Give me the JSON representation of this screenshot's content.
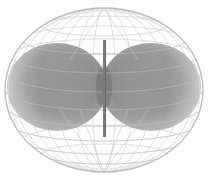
{
  "figure": {
    "title": "Dipole antenna radiation pattern",
    "colors": {
      "background": "#ffffff",
      "sphere_outline": "#c8c8c8",
      "grid_line": "#cfcfcf",
      "lobe_fill_light": "#bdbdbd",
      "lobe_fill_dark": "#7a7a7a",
      "antenna_rod": "#6a6a6a"
    },
    "sphere": {
      "cx": 104,
      "cy": 90,
      "rx": 99,
      "ry": 82
    },
    "lobes": [
      {
        "name": "left",
        "cx": 57,
        "cy": 87,
        "rx": 50,
        "ry": 44
      },
      {
        "name": "right",
        "cx": 151,
        "cy": 87,
        "rx": 50,
        "ry": 44
      }
    ],
    "antenna": {
      "x": 104.5,
      "y1": 40,
      "y2": 137,
      "width": 3
    }
  }
}
